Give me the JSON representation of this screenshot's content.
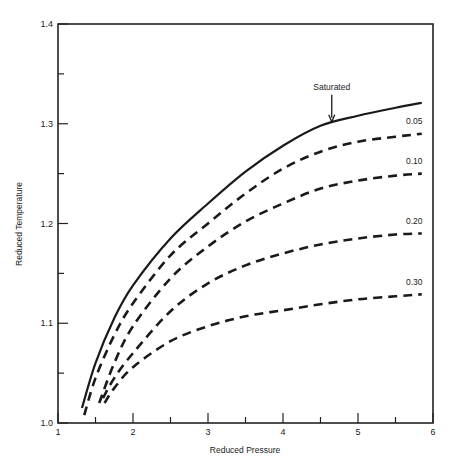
{
  "chart_data": {
    "type": "line",
    "title": "",
    "xlabel": "Reduced Pressure",
    "ylabel": "Reduced Temperature",
    "xlim": [
      1,
      6
    ],
    "ylim": [
      1.0,
      1.4
    ],
    "x_ticks": [
      1,
      2,
      3,
      4,
      5,
      6
    ],
    "x_minor_ticks": [
      1.5,
      2.5,
      3.5,
      4.5,
      5.5
    ],
    "y_ticks": [
      1.0,
      1.1,
      1.2,
      1.3,
      1.4
    ],
    "y_tick_labels": [
      "1.0",
      "1.1",
      "1.2",
      "1.3",
      "1.4"
    ],
    "y_minor_ticks": [
      1.05,
      1.15,
      1.25,
      1.35
    ],
    "grid": false,
    "legend": "inline labels at right end of curves",
    "series": [
      {
        "name": "Saturated",
        "style": "solid",
        "x": [
          1.32,
          1.5,
          1.75,
          2.0,
          2.5,
          3.0,
          3.5,
          4.0,
          4.5,
          5.0,
          5.5,
          5.85
        ],
        "y": [
          1.015,
          1.06,
          1.105,
          1.138,
          1.185,
          1.22,
          1.252,
          1.278,
          1.298,
          1.308,
          1.316,
          1.321
        ],
        "annotation": {
          "text": "Saturated",
          "arrow_to_x": 4.65,
          "arrow_to_y": 1.3
        }
      },
      {
        "name": "0.05",
        "style": "dashed",
        "x": [
          1.35,
          1.5,
          1.75,
          2.0,
          2.5,
          3.0,
          3.5,
          4.0,
          4.5,
          5.0,
          5.5,
          5.85
        ],
        "y": [
          1.008,
          1.045,
          1.088,
          1.12,
          1.168,
          1.2,
          1.23,
          1.255,
          1.272,
          1.282,
          1.287,
          1.29
        ]
      },
      {
        "name": "0.10",
        "style": "dashed",
        "x": [
          1.55,
          1.75,
          2.0,
          2.5,
          3.0,
          3.5,
          4.0,
          4.5,
          5.0,
          5.5,
          5.85
        ],
        "y": [
          1.02,
          1.06,
          1.097,
          1.145,
          1.177,
          1.202,
          1.22,
          1.235,
          1.243,
          1.248,
          1.25
        ]
      },
      {
        "name": "0.20",
        "style": "dashed",
        "x": [
          1.6,
          1.75,
          2.0,
          2.5,
          3.0,
          3.5,
          4.0,
          4.5,
          5.0,
          5.5,
          5.85
        ],
        "y": [
          1.025,
          1.045,
          1.07,
          1.112,
          1.14,
          1.158,
          1.17,
          1.179,
          1.185,
          1.189,
          1.19
        ]
      },
      {
        "name": "0.30",
        "style": "dashed",
        "x": [
          1.62,
          1.75,
          2.0,
          2.5,
          3.0,
          3.5,
          4.0,
          4.5,
          5.0,
          5.5,
          5.85
        ],
        "y": [
          1.02,
          1.035,
          1.056,
          1.082,
          1.097,
          1.107,
          1.113,
          1.119,
          1.124,
          1.127,
          1.129
        ]
      }
    ],
    "curve_labels": [
      {
        "text": "0.05",
        "x": 5.75,
        "y": 1.3
      },
      {
        "text": "0.10",
        "x": 5.75,
        "y": 1.26
      },
      {
        "text": "0.20",
        "x": 5.75,
        "y": 1.2
      },
      {
        "text": "0.30",
        "x": 5.75,
        "y": 1.138
      }
    ]
  }
}
